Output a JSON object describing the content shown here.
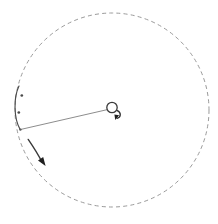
{
  "figure": {
    "width": 218,
    "height": 224,
    "background": "#ffffff"
  },
  "colors": {
    "orbit": "#9a9a9a",
    "rod": "#8d8d8d",
    "hub_stroke": "#3a3a3a",
    "arrow": "#1f1f1f",
    "sweep_arc": "#4a4a4a",
    "marker": "#4a4a4a"
  },
  "elements": {
    "orbit": {
      "name": "swept-path-circle",
      "cx": 112,
      "cy": 110,
      "r": 97,
      "style": "dashed",
      "dash": "4 3.2"
    },
    "pivot": {
      "name": "pivot-hub",
      "cx": 112,
      "cy": 107.5,
      "r": 5.2
    },
    "rod": {
      "name": "rod-segment",
      "x1": 110,
      "y1": 109,
      "x2": 20.5,
      "y2": 129.5,
      "length_px": 92
    },
    "spin_arrow": {
      "name": "pivot-rotation-arrow",
      "path": "M 117.3 110.6 C 121.4 112.4 121.2 117.2 117.1 118.4",
      "head": "119.1,115.2 115.3,120.1 114.4,114.6",
      "direction": "clockwise"
    },
    "motion_arrow": {
      "name": "rod-end-motion-arrow",
      "path": "M 28.2 139.4 C 33.4 147.0 38.4 155.0 42.0 162.0",
      "head": "38.0,160.6 45.6,166.0 43.2,157.0",
      "direction": "downward"
    },
    "sweep_arc": {
      "name": "angular-sweep-arc",
      "path": "M 19.0 86.0 C 13.6 97.0 13.4 118.0 20.2 129.6",
      "markers": [
        {
          "name": "sweep-tick-upper",
          "cx": 21.8,
          "cy": 95.5,
          "r": 1.35
        },
        {
          "name": "sweep-tick-lower",
          "cx": 18.8,
          "cy": 112.5,
          "r": 1.35
        }
      ],
      "endpoint_dot": {
        "cx": 20.4,
        "cy": 129.6,
        "r": 1.2
      }
    }
  }
}
